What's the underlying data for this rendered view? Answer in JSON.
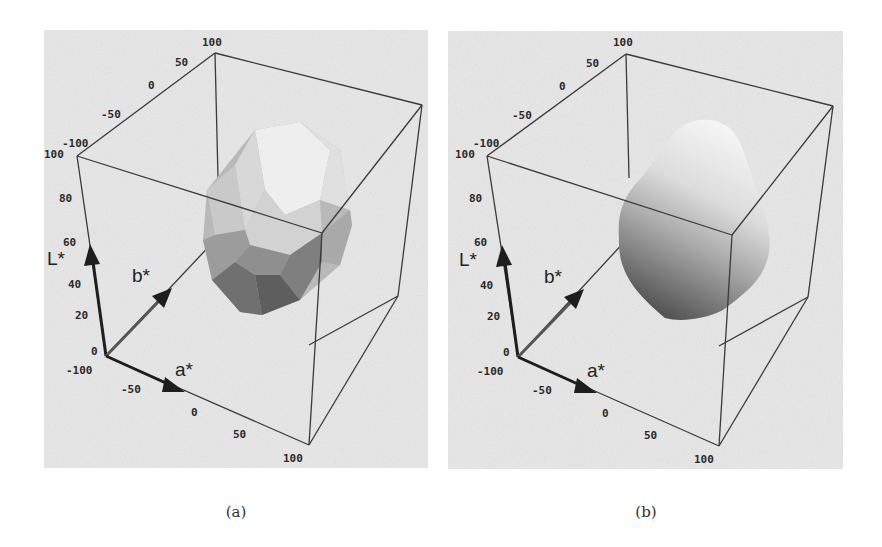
{
  "figure": {
    "panels": [
      {
        "id": "a",
        "caption": "(a)",
        "surface_style": "faceted polyhedron (coarse triangulated gamut)",
        "axes": {
          "L_label": "L*",
          "a_label": "a*",
          "b_label": "b*",
          "L_ticks": [
            "0",
            "20",
            "40",
            "60",
            "80",
            "100"
          ],
          "a_ticks": [
            "-100",
            "-50",
            "0",
            "50",
            "100"
          ],
          "b_ticks": [
            "-100",
            "-50",
            "0",
            "50",
            "100"
          ]
        }
      },
      {
        "id": "b",
        "caption": "(b)",
        "surface_style": "smooth shaded surface (refined gamut)",
        "axes": {
          "L_label": "L*",
          "a_label": "a*",
          "b_label": "b*",
          "L_ticks": [
            "0",
            "20",
            "40",
            "60",
            "80",
            "100"
          ],
          "a_ticks": [
            "-100",
            "-50",
            "0",
            "50",
            "100"
          ],
          "b_ticks": [
            "-100",
            "-50",
            "0",
            "50",
            "100"
          ]
        }
      }
    ],
    "colors": {
      "plot_background": "#e6e6e6",
      "box_edge": "#3a3a3a",
      "arrow": "#1e1e1e",
      "surface_light": "#f2f2f2",
      "surface_dark": "#4a4a4a"
    }
  }
}
